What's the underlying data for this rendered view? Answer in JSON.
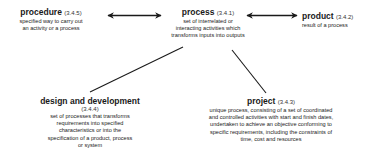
{
  "diagram": {
    "nodes": [
      {
        "id": "procedure",
        "title": "procedure",
        "ref": "(3.4.5)",
        "description_lines": [
          "specified way to carry out",
          "an activity or a process"
        ]
      },
      {
        "id": "process",
        "title": "process",
        "ref": "(3.4.1)",
        "description_lines": [
          "set of interrelated or",
          "interacting activities which",
          "transforms inputs into outputs"
        ]
      },
      {
        "id": "product",
        "title": "product",
        "ref": "(3.4.2)",
        "description_lines": [
          "result of a process"
        ]
      },
      {
        "id": "design_and_development",
        "title": "design and development",
        "ref": "(3.4.4)",
        "description_lines": [
          "set of processes that transforms",
          "requirements into specified",
          "characteristics  or into the",
          "specification of a product, process",
          "or system"
        ]
      },
      {
        "id": "project",
        "title": "project",
        "ref": "(3.4.3)",
        "description_lines": [
          "unique process, consisting of a set of coordinated",
          "and controlled activities with start and finish dates,",
          "undertaken to achieve an objective conforming to",
          "specific requirements, including the constraints of",
          "time, cost and resources"
        ]
      }
    ],
    "edges": [
      {
        "from": "procedure",
        "to": "process",
        "type": "double-arrow"
      },
      {
        "from": "process",
        "to": "product",
        "type": "double-arrow"
      },
      {
        "from": "process",
        "to": "design_and_development",
        "type": "line"
      },
      {
        "from": "process",
        "to": "project",
        "type": "line"
      }
    ],
    "colors": {
      "line": "#1a1a1a",
      "text": "#1a1a1a",
      "background": "#ffffff"
    }
  }
}
